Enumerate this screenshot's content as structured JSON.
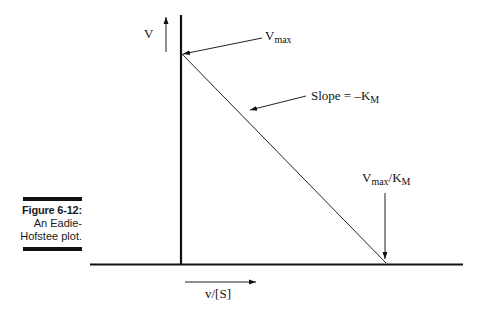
{
  "figure": {
    "number_label": "Figure 6-12:",
    "caption_line1": "An Eadie-",
    "caption_line2": "Hofstee plot."
  },
  "diagram": {
    "y_axis_label": "V",
    "x_axis_label": "v/[S]",
    "annotations": {
      "vmax": {
        "main": "V",
        "sub": "max"
      },
      "slope": {
        "main": "Slope = –K",
        "sub": "M"
      },
      "intercept": {
        "main": "V",
        "sub1": "max",
        "sep": "/K",
        "sub2": "M"
      }
    },
    "colors": {
      "line": "#111111",
      "background": "#ffffff"
    }
  }
}
